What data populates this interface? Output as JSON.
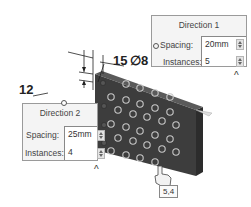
{
  "direction1": {
    "title": "Direction 1",
    "spacing_label": "Spacing:",
    "spacing_value": "20mm",
    "instances_label": "Instances:",
    "instances_value": "5",
    "collapse_icon": "^"
  },
  "direction2": {
    "title": "Direction 2",
    "spacing_label": "Spacing:",
    "spacing_value": "25mm",
    "instances_label": "Instances:",
    "instances_value": "4",
    "collapse_icon": "^"
  },
  "dimensions": {
    "offset_vertical": "12",
    "offset_horizontal": "15",
    "hole_diameter": "∅8"
  },
  "cursor_tooltip": "5,4",
  "colors": {
    "block_front": "#3d3d3d",
    "block_top": "#555555",
    "block_side": "#2c2c2c",
    "hole_ring": "#c8c8c8",
    "panel_bg": "#f4f4f4"
  }
}
